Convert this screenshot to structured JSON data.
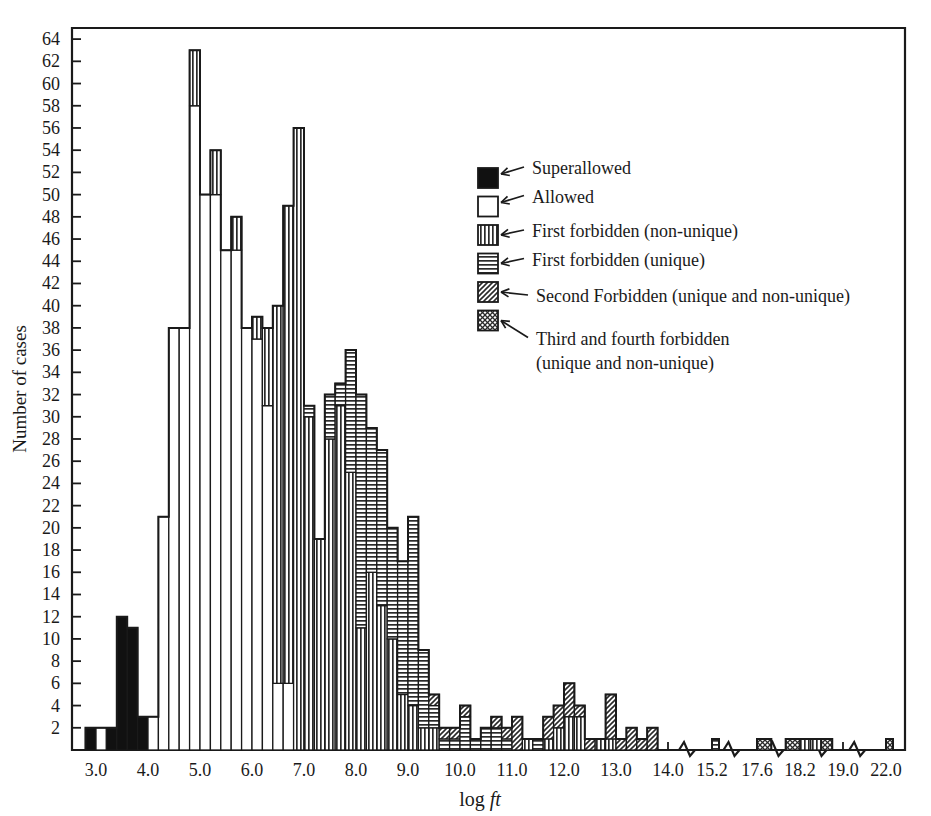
{
  "chart_data": {
    "type": "bar",
    "title": "",
    "xlabel": "log ft",
    "ylabel": "Number of cases",
    "xlim": [
      2.6,
      22.4
    ],
    "ylim": [
      0,
      65
    ],
    "grid": false,
    "bin_width": 0.2,
    "legend_position": "inside-right",
    "ytick_values": [
      2,
      4,
      6,
      8,
      10,
      12,
      14,
      16,
      18,
      20,
      22,
      24,
      26,
      28,
      30,
      32,
      34,
      36,
      38,
      40,
      42,
      44,
      46,
      48,
      50,
      52,
      54,
      56,
      58,
      60,
      62,
      64
    ],
    "xtick_labels": [
      "3.0",
      "4.0",
      "5.0",
      "6.0",
      "7.0",
      "8.0",
      "9.0",
      "10.0",
      "11.0",
      "12.0",
      "13.0",
      "14.0",
      "15.2",
      "17.6",
      "18.2",
      "19.0",
      "22.0"
    ],
    "xtick_values": [
      3.0,
      4.0,
      5.0,
      6.0,
      7.0,
      8.0,
      9.0,
      10.0,
      11.0,
      12.0,
      13.0,
      14.0,
      15.2,
      17.6,
      18.2,
      19.0,
      22.0
    ],
    "axis_breaks": [
      14.6,
      16.4,
      17.9,
      18.6,
      20.2
    ],
    "series": [
      {
        "name": "Superallowed",
        "pattern": "solid-black",
        "color": "#111111"
      },
      {
        "name": "Allowed",
        "pattern": "empty-white",
        "color": "#ffffff"
      },
      {
        "name": "First forbidden (non-unique)",
        "pattern": "vertical-stripes",
        "color": "#c8c8c8"
      },
      {
        "name": "First forbidden (unique)",
        "pattern": "horizontal-stripes",
        "color": "#c8c8c8"
      },
      {
        "name": "Second Forbidden (unique and non-unique)",
        "pattern": "diagonal-hatch",
        "color": "#c8c8c8"
      },
      {
        "name": "Third and fourth forbidden (unique and non-unique)",
        "pattern": "cross-hatch",
        "color": "#c8c8c8"
      }
    ],
    "bins": [
      {
        "x": 2.8,
        "v": [
          2,
          0,
          0,
          0,
          0,
          0
        ]
      },
      {
        "x": 3.0,
        "v": [
          0,
          2,
          0,
          0,
          0,
          0
        ]
      },
      {
        "x": 3.2,
        "v": [
          2,
          0,
          0,
          0,
          0,
          0
        ]
      },
      {
        "x": 3.4,
        "v": [
          12,
          0,
          0,
          0,
          0,
          0
        ]
      },
      {
        "x": 3.6,
        "v": [
          11,
          0,
          0,
          0,
          0,
          0
        ]
      },
      {
        "x": 3.8,
        "v": [
          3,
          0,
          0,
          0,
          0,
          0
        ]
      },
      {
        "x": 4.0,
        "v": [
          0,
          3,
          0,
          0,
          0,
          0
        ]
      },
      {
        "x": 4.2,
        "v": [
          0,
          21,
          0,
          0,
          0,
          0
        ]
      },
      {
        "x": 4.4,
        "v": [
          0,
          38,
          0,
          0,
          0,
          0
        ]
      },
      {
        "x": 4.6,
        "v": [
          0,
          38,
          0,
          0,
          0,
          0
        ]
      },
      {
        "x": 4.8,
        "v": [
          0,
          58,
          5,
          0,
          0,
          0
        ]
      },
      {
        "x": 5.0,
        "v": [
          0,
          50,
          0,
          0,
          0,
          0
        ]
      },
      {
        "x": 5.2,
        "v": [
          0,
          50,
          4,
          0,
          0,
          0
        ]
      },
      {
        "x": 5.4,
        "v": [
          0,
          45,
          0,
          0,
          0,
          0
        ]
      },
      {
        "x": 5.6,
        "v": [
          0,
          45,
          3,
          0,
          0,
          0
        ]
      },
      {
        "x": 5.8,
        "v": [
          0,
          38,
          0,
          0,
          0,
          0
        ]
      },
      {
        "x": 6.0,
        "v": [
          0,
          37,
          2,
          0,
          0,
          0
        ]
      },
      {
        "x": 6.2,
        "v": [
          0,
          31,
          7,
          0,
          0,
          0
        ]
      },
      {
        "x": 6.4,
        "v": [
          0,
          6,
          34,
          0,
          0,
          0
        ]
      },
      {
        "x": 6.6,
        "v": [
          0,
          6,
          43,
          0,
          0,
          0
        ]
      },
      {
        "x": 6.8,
        "v": [
          0,
          0,
          56,
          0,
          0,
          0
        ]
      },
      {
        "x": 7.0,
        "v": [
          0,
          0,
          30,
          1,
          0,
          0
        ]
      },
      {
        "x": 7.2,
        "v": [
          0,
          0,
          19,
          0,
          0,
          0
        ]
      },
      {
        "x": 7.4,
        "v": [
          0,
          0,
          28,
          4,
          0,
          0
        ]
      },
      {
        "x": 7.6,
        "v": [
          0,
          0,
          31,
          2,
          0,
          0
        ]
      },
      {
        "x": 7.8,
        "v": [
          0,
          0,
          25,
          11,
          0,
          0
        ]
      },
      {
        "x": 8.0,
        "v": [
          0,
          0,
          11,
          21,
          0,
          0
        ]
      },
      {
        "x": 8.2,
        "v": [
          0,
          0,
          16,
          13,
          0,
          0
        ]
      },
      {
        "x": 8.4,
        "v": [
          0,
          0,
          13,
          14,
          0,
          0
        ]
      },
      {
        "x": 8.6,
        "v": [
          0,
          0,
          10,
          10,
          0,
          0
        ]
      },
      {
        "x": 8.8,
        "v": [
          0,
          0,
          5,
          12,
          0,
          0
        ]
      },
      {
        "x": 9.0,
        "v": [
          0,
          0,
          4,
          17,
          0,
          0
        ]
      },
      {
        "x": 9.2,
        "v": [
          0,
          0,
          2,
          7,
          0,
          0
        ]
      },
      {
        "x": 9.4,
        "v": [
          0,
          0,
          2,
          2,
          1,
          0
        ]
      },
      {
        "x": 9.6,
        "v": [
          0,
          0,
          0,
          1,
          1,
          0
        ]
      },
      {
        "x": 9.8,
        "v": [
          0,
          0,
          0,
          1,
          1,
          0
        ]
      },
      {
        "x": 10.0,
        "v": [
          0,
          0,
          0,
          3,
          1,
          0
        ]
      },
      {
        "x": 10.2,
        "v": [
          0,
          0,
          0,
          1,
          0,
          0
        ]
      },
      {
        "x": 10.4,
        "v": [
          0,
          0,
          0,
          2,
          0,
          0
        ]
      },
      {
        "x": 10.6,
        "v": [
          0,
          0,
          0,
          2,
          1,
          0
        ]
      },
      {
        "x": 10.8,
        "v": [
          0,
          0,
          0,
          1,
          1,
          0
        ]
      },
      {
        "x": 11.0,
        "v": [
          0,
          0,
          0,
          0,
          3,
          0
        ]
      },
      {
        "x": 11.2,
        "v": [
          0,
          0,
          1,
          0,
          0,
          0
        ]
      },
      {
        "x": 11.4,
        "v": [
          0,
          0,
          0,
          1,
          0,
          0
        ]
      },
      {
        "x": 11.6,
        "v": [
          0,
          0,
          1,
          0,
          2,
          0
        ]
      },
      {
        "x": 11.8,
        "v": [
          0,
          0,
          2,
          0,
          2,
          0
        ]
      },
      {
        "x": 12.0,
        "v": [
          0,
          0,
          3,
          0,
          3,
          0
        ]
      },
      {
        "x": 12.2,
        "v": [
          0,
          0,
          3,
          0,
          1,
          0
        ]
      },
      {
        "x": 12.4,
        "v": [
          0,
          0,
          0,
          0,
          1,
          0
        ]
      },
      {
        "x": 12.6,
        "v": [
          0,
          0,
          1,
          0,
          0,
          0
        ]
      },
      {
        "x": 12.8,
        "v": [
          0,
          0,
          1,
          0,
          4,
          0
        ]
      },
      {
        "x": 13.0,
        "v": [
          0,
          0,
          0,
          0,
          1,
          0
        ]
      },
      {
        "x": 13.2,
        "v": [
          0,
          0,
          0,
          0,
          2,
          0
        ]
      },
      {
        "x": 13.4,
        "v": [
          0,
          0,
          0,
          0,
          1,
          0
        ]
      },
      {
        "x": 13.6,
        "v": [
          0,
          0,
          0,
          0,
          2,
          0
        ]
      },
      {
        "x": 15.2,
        "v": [
          0,
          0,
          0,
          1,
          0,
          0
        ]
      },
      {
        "x": 17.6,
        "v": [
          0,
          0,
          0,
          0,
          0,
          1
        ]
      },
      {
        "x": 18.0,
        "v": [
          0,
          0,
          0,
          0,
          0,
          1
        ]
      },
      {
        "x": 18.2,
        "v": [
          0,
          0,
          1,
          0,
          0,
          0
        ]
      },
      {
        "x": 18.4,
        "v": [
          0,
          0,
          1,
          0,
          0,
          0
        ]
      },
      {
        "x": 18.6,
        "v": [
          0,
          0,
          0,
          0,
          0,
          1
        ]
      },
      {
        "x": 22.0,
        "v": [
          0,
          0,
          0,
          0,
          0,
          1
        ]
      }
    ]
  },
  "axes": {
    "y_title": "Number of cases",
    "x_title_prefix": "log ",
    "x_title_italic": "ft"
  },
  "legend": {
    "items": [
      {
        "label": "Superallowed",
        "pattern": "solid-black"
      },
      {
        "label": "Allowed",
        "pattern": "empty-white"
      },
      {
        "label": "First forbidden (non-unique)",
        "pattern": "vertical-stripes"
      },
      {
        "label": "First forbidden (unique)",
        "pattern": "horizontal-stripes"
      },
      {
        "label": "Second Forbidden (unique and non-unique)",
        "pattern": "diagonal-hatch"
      },
      {
        "label": "Third and fourth forbidden",
        "label2": "(unique and non-unique)",
        "pattern": "cross-hatch"
      }
    ]
  }
}
